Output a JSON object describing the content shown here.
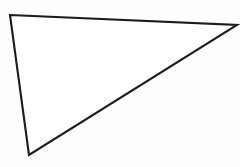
{
  "figure": {
    "name": "triangle",
    "caption": "",
    "background_color": "#fefefe",
    "stroke_color": "#1b1b1b",
    "fill_color": "#ffffff",
    "stroke_width_px": 2.1,
    "canvas": {
      "width": 240,
      "height": 167
    }
  },
  "chart_data": {
    "type": "diagram",
    "shape": "triangle",
    "title": "",
    "xlabel": "",
    "ylabel": "",
    "grid": false,
    "legend": "none",
    "xlim": [
      0,
      240
    ],
    "ylim": [
      0,
      167
    ],
    "vertices": [
      {
        "label": "A",
        "x": 10,
        "y": 15
      },
      {
        "label": "B",
        "x": 237,
        "y": 25
      },
      {
        "label": "C",
        "x": 29,
        "y": 155
      }
    ],
    "edges": [
      {
        "from": "A",
        "to": "B",
        "name": "top-edge"
      },
      {
        "from": "B",
        "to": "C",
        "name": "hypotenuse"
      },
      {
        "from": "C",
        "to": "A",
        "name": "left-edge"
      }
    ],
    "path_d": "M 10 15 L 237 25 L 29 155 Z",
    "annotations": []
  }
}
